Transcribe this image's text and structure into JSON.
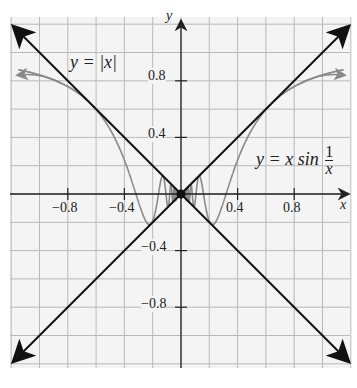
{
  "chart_data": {
    "type": "line",
    "title": "",
    "xlabel": "x",
    "ylabel": "y",
    "xlim": [
      -1.2,
      1.2
    ],
    "ylim": [
      -1.2,
      1.2
    ],
    "grid": true,
    "grid_step": 0.2,
    "x_ticks": [
      -0.8,
      -0.4,
      0.4,
      0.8
    ],
    "x_tick_labels": [
      "−0.8",
      "−0.4",
      "0.4",
      "0.8"
    ],
    "y_ticks": [
      0.8,
      0.4,
      -0.4,
      -0.8
    ],
    "y_tick_labels": [
      "0.8",
      "0.4",
      "−0.4",
      "−0.8"
    ],
    "series": [
      {
        "name": "y = |x|",
        "expression": "abs(x)",
        "color": "#111111"
      },
      {
        "name": "y = −|x|",
        "expression": "-abs(x)",
        "color": "#111111"
      },
      {
        "name": "y = x sin(1/x)",
        "expression": "x*sin(1/x)",
        "color": "#8a8a8a"
      }
    ],
    "annotations": [
      {
        "text": "y = |x|",
        "near": [
          -0.6,
          0.9
        ]
      },
      {
        "text": "y = x sin 1/x",
        "near": [
          0.7,
          0.35
        ]
      }
    ],
    "origin_point": [
      0,
      0
    ]
  },
  "labels": {
    "x_axis": "x",
    "y_axis": "y",
    "abs_curve": "y = |x|",
    "sin_curve_prefix": "y = x sin",
    "sin_num": "1",
    "sin_den": "x",
    "tick_x_m08": "−0.8",
    "tick_x_m04": "−0.4",
    "tick_x_p04": "0.4",
    "tick_x_p08": "0.8",
    "tick_y_p08": "0.8",
    "tick_y_p04": "0.4",
    "tick_y_m04": "−0.4",
    "tick_y_m08": "−0.8"
  },
  "colors": {
    "grid": "#b9b9b9",
    "axes": "#222222",
    "lines": "#111111",
    "curve": "#8a8a8a",
    "background": "#f4f4f4"
  }
}
